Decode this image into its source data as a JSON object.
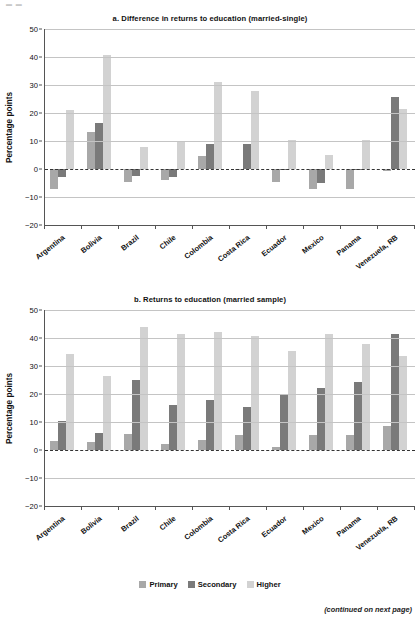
{
  "page": {
    "header_mark": "▬ ▬",
    "footnote": "(continued on next page)"
  },
  "legend": {
    "items": [
      {
        "label": "Primary",
        "color": "#a8a8a8",
        "key": "primary"
      },
      {
        "label": "Secondary",
        "color": "#7a7a7a",
        "key": "secondary"
      },
      {
        "label": "Higher",
        "color": "#d2d2d2",
        "key": "higher"
      }
    ]
  },
  "chart_data": [
    {
      "id": "panel-a",
      "type": "bar",
      "title": "a. Difference in returns to education (married-single)",
      "xlabel": "",
      "ylabel": "Percentage points",
      "ylim": [
        -20,
        50
      ],
      "yticks": [
        50,
        40,
        30,
        20,
        10,
        0,
        -10,
        -20
      ],
      "ytick_labels": [
        "50",
        "40",
        "30",
        "20",
        "10",
        "0",
        "−10",
        "−20"
      ],
      "grid": true,
      "zero_line": true,
      "legend_position": "bottom-shared",
      "categories": [
        "Argentina",
        "Bolivia",
        "Brazil",
        "Chile",
        "Colombia",
        "Costa Rica",
        "Ecuador",
        "Mexico",
        "Panama",
        "Venezuela, RB"
      ],
      "series": [
        {
          "name": "Primary",
          "color": "#a8a8a8",
          "values": [
            -7.0,
            13.2,
            -4.5,
            -4.0,
            4.7,
            -0.3,
            -4.5,
            -7.2,
            -7.0,
            -0.8
          ]
        },
        {
          "name": "Secondary",
          "color": "#7a7a7a",
          "values": [
            -3.0,
            16.5,
            -2.5,
            -3.0,
            8.8,
            8.8,
            -0.3,
            -5.0,
            -0.3,
            25.8
          ]
        },
        {
          "name": "Higher",
          "color": "#d2d2d2",
          "values": [
            21.2,
            40.7,
            8.0,
            10.0,
            31.2,
            28.0,
            10.4,
            4.9,
            10.4,
            21.5
          ]
        }
      ]
    },
    {
      "id": "panel-b",
      "type": "bar",
      "title": "b. Returns to education (married sample)",
      "xlabel": "",
      "ylabel": "Percentage points",
      "ylim": [
        -20,
        50
      ],
      "yticks": [
        50,
        40,
        30,
        20,
        10,
        0,
        -10,
        -20
      ],
      "ytick_labels": [
        "50",
        "40",
        "30",
        "20",
        "10",
        "0",
        "−10",
        "−20"
      ],
      "grid": true,
      "zero_line": true,
      "legend_position": "bottom",
      "categories": [
        "Argentina",
        "Bolivia",
        "Brazil",
        "Chile",
        "Colombia",
        "Costa Rica",
        "Ecuador",
        "Mexico",
        "Panama",
        "Venezuela, RB"
      ],
      "series": [
        {
          "name": "Primary",
          "color": "#a8a8a8",
          "values": [
            3.2,
            2.8,
            5.8,
            2.2,
            3.6,
            5.2,
            1.0,
            5.2,
            5.2,
            8.7
          ]
        },
        {
          "name": "Secondary",
          "color": "#7a7a7a",
          "values": [
            10.4,
            5.9,
            25.1,
            16.2,
            18.0,
            15.2,
            20.0,
            22.2,
            24.3,
            41.4
          ]
        },
        {
          "name": "Higher",
          "color": "#d2d2d2",
          "values": [
            34.4,
            26.4,
            43.8,
            41.5,
            42.3,
            40.8,
            35.5,
            41.5,
            37.8,
            33.7
          ]
        }
      ]
    }
  ]
}
